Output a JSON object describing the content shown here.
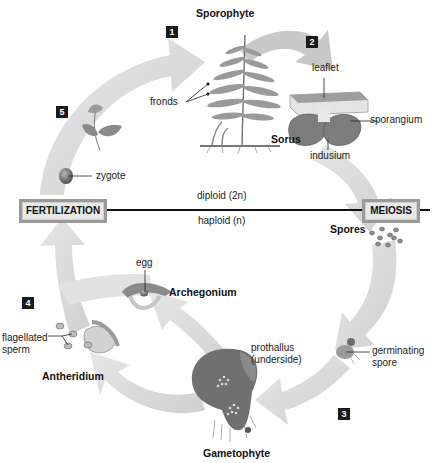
{
  "steps": [
    "1",
    "2",
    "3",
    "4",
    "5"
  ],
  "stages": {
    "fertilization": "FERTILIZATION",
    "meiosis": "MEIOSIS"
  },
  "ploidy": {
    "diploid": "diploid (2n)",
    "haploid": "haploid (n)"
  },
  "labels": {
    "sporophyte": "Sporophyte",
    "fronds": "fronds",
    "leaflet": "leaflet",
    "sporangium": "sporangium",
    "sorus": "Sorus",
    "indusium": "indusium",
    "spores": "Spores",
    "germinating_spore_1": "germinating",
    "germinating_spore_2": "spore",
    "prothallus_1": "prothallus",
    "prothallus_2": "(underside)",
    "gametophyte": "Gametophyte",
    "egg": "egg",
    "archegonium": "Archegonium",
    "flagellated_sperm_1": "flagellated",
    "flagellated_sperm_2": "sperm",
    "antheridium": "Antheridium",
    "zygote": "zygote"
  },
  "colors": {
    "arrow": "#d9d9d9",
    "arrow_dark": "#bdbdbd",
    "tissue": "#8a8a8a",
    "tissue_dark": "#6a6a6a",
    "line": "#111111"
  }
}
